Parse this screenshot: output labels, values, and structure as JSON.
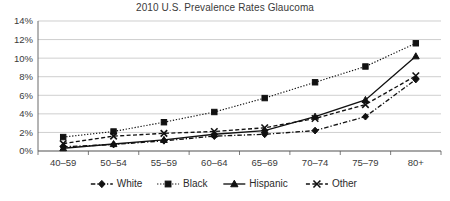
{
  "chart_data": {
    "type": "line",
    "title": "2010 U.S. Prevalence Rates Glaucoma",
    "xlabel": "",
    "ylabel": "",
    "categories": [
      "40–59",
      "50–54",
      "55–59",
      "60–64",
      "65–69",
      "70–74",
      "75–79",
      "80+"
    ],
    "ytick_labels": [
      "0%",
      "2%",
      "4%",
      "6%",
      "8%",
      "10%",
      "12%",
      "14%"
    ],
    "ytick_values": [
      0,
      2,
      4,
      6,
      8,
      10,
      12,
      14
    ],
    "ylim": [
      0,
      14
    ],
    "grid": true,
    "legend_position": "bottom",
    "series": [
      {
        "name": "White",
        "marker": "diamond",
        "dash": "dash-dot",
        "color": "#111111",
        "values": [
          0.45,
          0.7,
          1.1,
          1.6,
          1.8,
          2.2,
          3.7,
          7.7
        ]
      },
      {
        "name": "Black",
        "marker": "square",
        "dash": "dotted",
        "color": "#111111",
        "values": [
          1.5,
          2.1,
          3.1,
          4.2,
          5.7,
          7.4,
          9.1,
          11.6
        ]
      },
      {
        "name": "Hispanic",
        "marker": "triangle",
        "dash": "solid",
        "color": "#111111",
        "values": [
          0.3,
          0.75,
          1.2,
          1.8,
          2.2,
          3.7,
          5.5,
          10.2
        ]
      },
      {
        "name": "Other",
        "marker": "x",
        "dash": "dashed",
        "color": "#111111",
        "values": [
          0.8,
          1.6,
          1.9,
          2.1,
          2.5,
          3.5,
          5.0,
          8.1
        ]
      }
    ]
  }
}
